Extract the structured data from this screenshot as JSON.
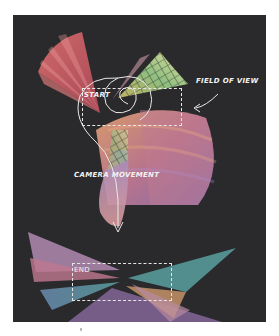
{
  "figure": {
    "type": "camera path illustration",
    "background": "#ffffff",
    "panel_color": "#2a2a2c",
    "annotation_color": "#f2f2f2"
  },
  "labels": {
    "start": "START",
    "end": "END",
    "field_of_view": "FIELD OF VIEW",
    "camera_movement": "CAMERA MOVEMENT"
  },
  "frames": [
    {
      "name": "start-frame",
      "x": 82,
      "y": 88,
      "w": 98,
      "h": 36
    },
    {
      "name": "end-frame",
      "x": 72,
      "y": 263,
      "w": 98,
      "h": 36
    }
  ],
  "shapes": {
    "colors": {
      "red_fan": "#c85a5a",
      "pink_fan": "#d89a9a",
      "yellow_grid": "#d8c86a",
      "green_grid": "#8cc08a",
      "purple_dome": "#9a7ab8",
      "orange_dome": "#d89860",
      "blue_shard": "#6a8ab0",
      "teal_shard": "#5aa0a0"
    }
  }
}
